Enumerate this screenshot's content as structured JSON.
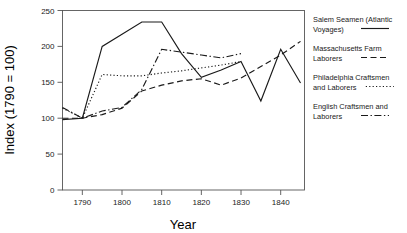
{
  "chart_data": {
    "type": "line",
    "title": "",
    "xlabel": "Year",
    "ylabel": "Index (1790 = 100)",
    "xlim": [
      1785,
      1846
    ],
    "ylim": [
      0,
      250
    ],
    "xticks": [
      1790,
      1800,
      1810,
      1820,
      1830,
      1840
    ],
    "yticks": [
      0,
      50,
      100,
      150,
      200,
      250
    ],
    "xtick_labels": [
      "1790",
      "1800",
      "1810",
      "1820",
      "1830",
      "1840"
    ],
    "ytick_labels": [
      "0",
      "50",
      "100",
      "150",
      "200",
      "250"
    ],
    "grid": false,
    "legend_position": "right",
    "series": [
      {
        "name": "Salem Seamen (Atlantic Voyages)",
        "style": "solid",
        "dasharray": "none",
        "x": [
          1785,
          1790,
          1795,
          1800,
          1805,
          1810,
          1815,
          1820,
          1825,
          1830,
          1835,
          1840,
          1845
        ],
        "values": [
          98,
          100,
          200,
          217,
          234,
          234,
          190,
          157,
          167,
          179,
          124,
          196,
          149
        ]
      },
      {
        "name": "Massachusetts Farm Laborers",
        "style": "dashed",
        "dasharray": "6,3.5",
        "x": [
          1785,
          1790,
          1795,
          1800,
          1805,
          1810,
          1815,
          1820,
          1825,
          1830,
          1835,
          1840,
          1845
        ],
        "values": [
          100,
          100,
          105,
          114,
          138,
          146,
          152,
          155,
          146,
          156,
          172,
          188,
          207
        ]
      },
      {
        "name": "Philadelphia Craftsmen and Laborers",
        "style": "dotted",
        "dasharray": "1.2,2.2",
        "x": [
          1785,
          1790,
          1795,
          1800,
          1805,
          1810,
          1815,
          1820,
          1825,
          1830
        ],
        "values": [
          114,
          100,
          161,
          159,
          159,
          163,
          166,
          170,
          174,
          179
        ]
      },
      {
        "name": "English Craftsmen and Laborers",
        "style": "dashdot",
        "dasharray": "7,2.5,1.4,2.5",
        "x": [
          1785,
          1790,
          1795,
          1800,
          1805,
          1810,
          1815,
          1820,
          1825,
          1830
        ],
        "values": [
          115,
          100,
          110,
          115,
          140,
          196,
          192,
          188,
          184,
          190
        ]
      }
    ]
  },
  "legend": {
    "items": [
      {
        "label_line1": "Salem Seamen (Atlantic",
        "label_line2": "Voyages)"
      },
      {
        "label_line1": "Massachusetts Farm",
        "label_line2": "Laborers"
      },
      {
        "label_line1": "Philadelphia Craftsmen",
        "label_line2": "and Laborers"
      },
      {
        "label_line1": "English Craftsmen and",
        "label_line2": "Laborers"
      }
    ]
  },
  "colors": {
    "line": "#1a1a1a",
    "axis": "#555555",
    "background": "#ffffff",
    "text": "#1a1a1a"
  }
}
